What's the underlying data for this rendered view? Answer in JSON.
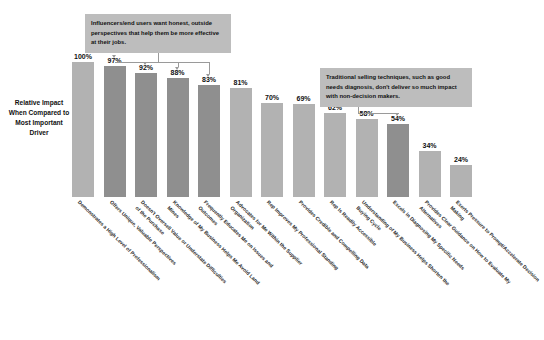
{
  "chart_data": {
    "type": "bar",
    "title": "",
    "xlabel": "",
    "ylabel": "Relative Impact When Compared to Most Important Driver",
    "ylim": [
      0,
      100
    ],
    "grid": false,
    "legend": "none",
    "categories": [
      "Demonstrates a High Level of Professionalism",
      "Offers Unique, Valuable Perspectives",
      "Doesn't Oversell Value or Understate Difficulties of the Purchase",
      "Knowledge of My Business Helps Me Avoid Land Mines",
      "Frequently Educates Me on Issues and Outcomes",
      "Advocates for Me Within the Supplier Organization",
      "Rep Improves My Professional Standing",
      "Provides Credible and Compelling Data",
      "Rep Is Readily Accessible",
      "Understanding of My Business Helps Shorten the Buying Cycle",
      "Excels in Diagnosing My Specific Needs",
      "Provides Clear Guidance on How to Evaluate My Alternatives",
      "Exerts Pressure to Prompt/Accelerate Decision Making"
    ],
    "values": [
      100,
      97,
      92,
      88,
      83,
      81,
      70,
      69,
      62,
      58,
      54,
      34,
      24
    ],
    "value_labels": [
      "100%",
      "97%",
      "92%",
      "88%",
      "83%",
      "81%",
      "70%",
      "69%",
      "62%",
      "58%",
      "54%",
      "34%",
      "24%"
    ],
    "highlighted_indices": [
      1,
      2,
      3,
      4,
      10
    ],
    "annotations": [
      {
        "id": "influencers",
        "text": "Influencers/end users want honest, outside perspectives that help them be more effective at their jobs.",
        "targets": [
          1,
          2,
          3,
          4
        ]
      },
      {
        "id": "traditional",
        "text": "Traditional selling techniques, such as good needs diagnosis, don't deliver so much impact with non-decision makers.",
        "targets": [
          10
        ]
      }
    ],
    "colors": {
      "bar": "#b2b2b2",
      "bar_highlight": "#8f8f8f",
      "callout_background": "#bdbdbd",
      "connector": "#9a9a9a",
      "background": "#ffffff",
      "text": "#111111"
    }
  }
}
